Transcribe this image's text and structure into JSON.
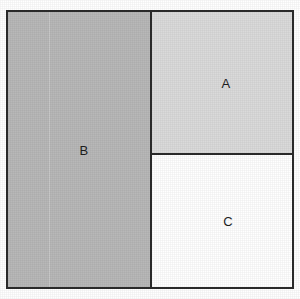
{
  "figure": {
    "background_color": "#ffffff",
    "border_color": "#2b2b2b",
    "border_width_px": 2
  },
  "regions": [
    {
      "id": "A",
      "label": "A",
      "position": "top-right",
      "fill_color": "#dadada",
      "fill_name": "light-gray"
    },
    {
      "id": "B",
      "label": "B",
      "position": "left-column",
      "fill_color": "#b8b8b8",
      "fill_name": "medium-gray"
    },
    {
      "id": "C",
      "label": "C",
      "position": "bottom-right",
      "fill_color": "#ffffff",
      "fill_name": "white"
    }
  ]
}
